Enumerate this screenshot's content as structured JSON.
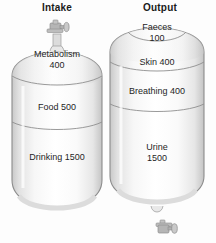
{
  "diagram": {
    "title_left": "Intake",
    "title_right": "Output",
    "ink_color": "#1f1f1f",
    "outline_color": "#8c8c8c",
    "body_light": "#ffffff",
    "body_shade": "#d8d8d8",
    "valve_color": "#a9a9a9",
    "background": "#fdfdfd"
  },
  "intake_tank": {
    "name": "Intake",
    "valve_position": "top",
    "segments": [
      {
        "label": "Metabolism",
        "value": "400",
        "two_line": true
      },
      {
        "label": "Food 500",
        "value": "",
        "two_line": false
      },
      {
        "label": "Drinking 1500",
        "value": "",
        "two_line": false
      }
    ]
  },
  "output_tank": {
    "name": "Output",
    "valve_position": "bottom",
    "segments": [
      {
        "label": "Faeces",
        "value": "100",
        "two_line": true
      },
      {
        "label": "Skin 400",
        "value": "",
        "two_line": false
      },
      {
        "label": "Breathing 400",
        "value": "",
        "two_line": false
      },
      {
        "label": "Urine",
        "value": "1500",
        "two_line": true
      }
    ]
  },
  "icons": {
    "valve_top": "valve-tap-icon",
    "valve_bottom": "valve-tap-icon"
  }
}
